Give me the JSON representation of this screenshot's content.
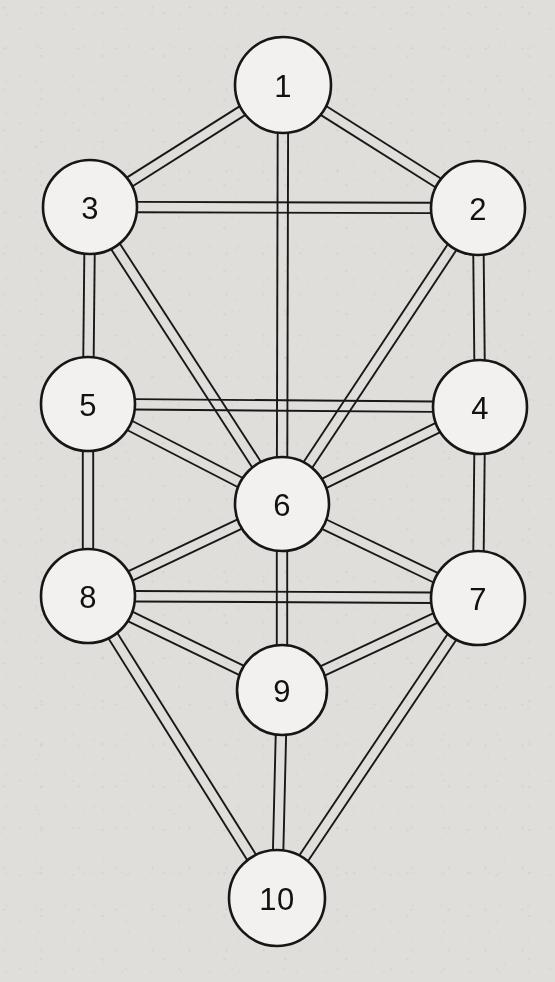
{
  "figure": {
    "background_color": "#efeeec",
    "ink_color": "#161616",
    "node_fill_color": "#f2f1ef"
  },
  "diagram_data": {
    "type": "graph",
    "node_count": 10,
    "edge_count": 22,
    "edge_style": "double-stroke parallel lines (hollow bar)",
    "node_shape": "circle",
    "nodes": [
      {
        "id": 1,
        "label": "1",
        "cx": 283,
        "cy": 85,
        "r": 48
      },
      {
        "id": 2,
        "label": "2",
        "cx": 478,
        "cy": 208,
        "r": 47
      },
      {
        "id": 3,
        "label": "3",
        "cx": 90,
        "cy": 207,
        "r": 47
      },
      {
        "id": 4,
        "label": "4",
        "cx": 480,
        "cy": 407,
        "r": 47
      },
      {
        "id": 5,
        "label": "5",
        "cx": 88,
        "cy": 404,
        "r": 47
      },
      {
        "id": 6,
        "label": "6",
        "cx": 282,
        "cy": 504,
        "r": 47
      },
      {
        "id": 7,
        "label": "7",
        "cx": 478,
        "cy": 598,
        "r": 47
      },
      {
        "id": 8,
        "label": "8",
        "cx": 88,
        "cy": 596,
        "r": 47
      },
      {
        "id": 9,
        "label": "9",
        "cx": 282,
        "cy": 690,
        "r": 45
      },
      {
        "id": 10,
        "label": "10",
        "cx": 277,
        "cy": 898,
        "r": 48
      }
    ],
    "edges": [
      [
        1,
        3
      ],
      [
        1,
        2
      ],
      [
        1,
        6
      ],
      [
        3,
        2
      ],
      [
        3,
        5
      ],
      [
        3,
        6
      ],
      [
        2,
        4
      ],
      [
        2,
        6
      ],
      [
        5,
        4
      ],
      [
        5,
        8
      ],
      [
        5,
        6
      ],
      [
        4,
        7
      ],
      [
        4,
        6
      ],
      [
        8,
        7
      ],
      [
        8,
        6
      ],
      [
        8,
        9
      ],
      [
        8,
        10
      ],
      [
        7,
        6
      ],
      [
        7,
        9
      ],
      [
        7,
        10
      ],
      [
        6,
        9
      ],
      [
        9,
        10
      ]
    ]
  }
}
